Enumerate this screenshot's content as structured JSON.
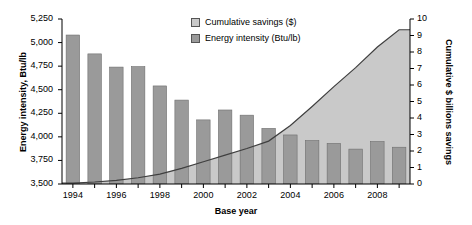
{
  "chart_data": {
    "type": "bar",
    "title": "",
    "xlabel": "Base year",
    "ylabel": "Energy intensity, Btu/lb",
    "ylabel_right": "Cumulative $ billions savings",
    "categories": [
      1994,
      1995,
      1996,
      1997,
      1998,
      1999,
      2000,
      2001,
      2002,
      2003,
      2004,
      2005,
      2006,
      2007,
      2008,
      2009
    ],
    "x_tick_labels": [
      "1994",
      "1996",
      "1998",
      "2000",
      "2002",
      "2004",
      "2006",
      "2008"
    ],
    "x_tick_values": [
      1994,
      1996,
      1998,
      2000,
      2002,
      2004,
      2006,
      2008
    ],
    "ylim": [
      3500,
      5250
    ],
    "y_ticks": [
      3500,
      3750,
      4000,
      4250,
      4500,
      4750,
      5000,
      5250
    ],
    "y_tick_labels": [
      "3,500",
      "3,750",
      "4,000",
      "4,250",
      "4,500",
      "4,750",
      "5,000",
      "5,250"
    ],
    "ylim_right": [
      0,
      10
    ],
    "y_ticks_right": [
      0,
      1,
      2,
      3,
      4,
      5,
      6,
      7,
      8,
      9,
      10
    ],
    "y_tick_labels_right": [
      "0",
      "1",
      "2",
      "3",
      "4",
      "5",
      "6",
      "7",
      "8",
      "9",
      "10"
    ],
    "grid": false,
    "legend_position": "top-center",
    "series": [
      {
        "name": "Cumulative savings ($)",
        "type": "area",
        "axis": "right",
        "color": "#c9c9c9",
        "line_color": "#3f3f3f",
        "values": [
          0.05,
          0.12,
          0.22,
          0.38,
          0.6,
          0.95,
          1.35,
          1.75,
          2.15,
          2.6,
          3.55,
          4.7,
          5.9,
          7.05,
          8.3,
          9.35
        ]
      },
      {
        "name": "Energy intensity (Btu/lb)",
        "type": "bar",
        "axis": "left",
        "color": "#9a9a9a",
        "line_color": "#6e6e6e",
        "values": [
          5080,
          4880,
          4740,
          4745,
          4540,
          4390,
          4180,
          4285,
          4230,
          4090,
          4020,
          3960,
          3930,
          3870,
          3950,
          3890
        ]
      }
    ]
  },
  "legend": {
    "items": [
      {
        "label": "Cumulative savings ($)",
        "swatch": "#c9c9c9"
      },
      {
        "label": "Energy intensity (Btu/lb)",
        "swatch": "#9a9a9a"
      }
    ]
  }
}
